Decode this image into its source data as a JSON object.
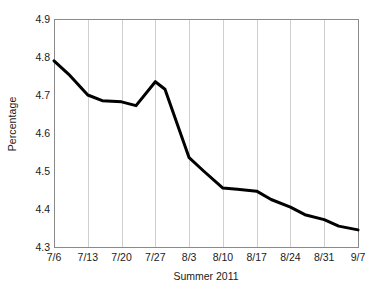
{
  "chart_data": {
    "type": "line",
    "title": "",
    "xlabel": "Summer 2011",
    "ylabel": "Percentage",
    "categories": [
      "7/6",
      "7/13",
      "7/20",
      "7/27",
      "8/3",
      "8/10",
      "8/17",
      "8/24",
      "8/31",
      "9/7"
    ],
    "ylim": [
      4.3,
      4.9
    ],
    "yticks": [
      "4.3",
      "4.4",
      "4.5",
      "4.6",
      "4.7",
      "4.8",
      "4.9"
    ],
    "ytick_values": [
      4.3,
      4.4,
      4.5,
      4.6,
      4.7,
      4.8,
      4.9
    ],
    "grid": "vertical",
    "legend": "none",
    "series": [
      {
        "name": "Percentage",
        "color": "#000000",
        "x": [
          "7/6",
          "7/9",
          "7/13",
          "7/16",
          "7/20",
          "7/23",
          "7/27",
          "7/29",
          "8/3",
          "8/6",
          "8/10",
          "8/13",
          "8/17",
          "8/20",
          "8/24",
          "8/27",
          "8/31",
          "9/3",
          "9/7"
        ],
        "values": [
          4.79,
          4.755,
          4.7,
          4.685,
          4.682,
          4.672,
          4.735,
          4.715,
          4.535,
          4.5,
          4.455,
          4.452,
          4.447,
          4.425,
          4.405,
          4.385,
          4.372,
          4.355,
          4.345
        ]
      }
    ]
  },
  "axis": {
    "y_title": "Percentage",
    "x_title": "Summer 2011"
  }
}
